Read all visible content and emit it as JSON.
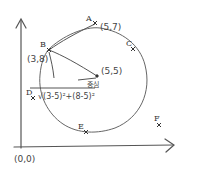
{
  "diagram": {
    "origin_label": "(0,0)",
    "center": {
      "label": "(5,5)",
      "caption": "중심"
    },
    "formula": "√(3-5)²+(8-5)²",
    "points": [
      {
        "name": "A",
        "coord": "(5,7)"
      },
      {
        "name": "B",
        "coord": "(3,8)"
      },
      {
        "name": "C",
        "coord": ""
      },
      {
        "name": "D",
        "coord": ""
      },
      {
        "name": "E",
        "coord": ""
      },
      {
        "name": "F",
        "coord": ""
      }
    ],
    "marker": "x",
    "colors": {
      "stroke": "#555555",
      "text": "#333333",
      "background": "#ffffff"
    }
  }
}
